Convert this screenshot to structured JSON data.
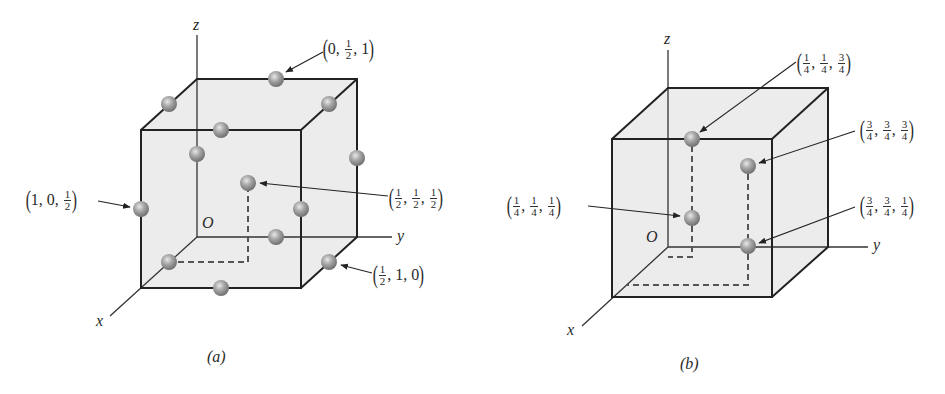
{
  "figures": [
    {
      "id": "a",
      "caption": "(a)",
      "axes": {
        "x": "x",
        "y": "y",
        "z": "z",
        "origin": "O"
      },
      "atoms": [
        {
          "label_parts": [
            {
              "t": "0"
            },
            {
              "n": "1",
              "d": "2"
            },
            {
              "t": "1"
            }
          ],
          "coords": "(0, 1/2, 1)"
        },
        {
          "label_parts": [
            {
              "t": "1"
            },
            {
              "t": "0"
            },
            {
              "n": "1",
              "d": "2"
            }
          ],
          "coords": "(1, 0, 1/2)"
        },
        {
          "label_parts": [
            {
              "n": "1",
              "d": "2"
            },
            {
              "n": "1",
              "d": "2"
            },
            {
              "n": "1",
              "d": "2"
            }
          ],
          "coords": "(1/2, 1/2, 1/2)"
        },
        {
          "label_parts": [
            {
              "n": "1",
              "d": "2"
            },
            {
              "t": "1"
            },
            {
              "t": "0"
            }
          ],
          "coords": "(1/2, 1, 0)"
        }
      ]
    },
    {
      "id": "b",
      "caption": "(b)",
      "axes": {
        "x": "x",
        "y": "y",
        "z": "z",
        "origin": "O"
      },
      "atoms": [
        {
          "label_parts": [
            {
              "n": "1",
              "d": "4"
            },
            {
              "n": "1",
              "d": "4"
            },
            {
              "n": "3",
              "d": "4"
            }
          ],
          "coords": "(1/4, 1/4, 3/4)"
        },
        {
          "label_parts": [
            {
              "n": "3",
              "d": "4"
            },
            {
              "n": "3",
              "d": "4"
            },
            {
              "n": "3",
              "d": "4"
            }
          ],
          "coords": "(3/4, 3/4, 3/4)"
        },
        {
          "label_parts": [
            {
              "n": "1",
              "d": "4"
            },
            {
              "n": "1",
              "d": "4"
            },
            {
              "n": "1",
              "d": "4"
            }
          ],
          "coords": "(1/4, 1/4, 1/4)"
        },
        {
          "label_parts": [
            {
              "n": "3",
              "d": "4"
            },
            {
              "n": "3",
              "d": "4"
            },
            {
              "n": "1",
              "d": "4"
            }
          ],
          "coords": "(3/4, 3/4, 1/4)"
        }
      ]
    }
  ],
  "colors": {
    "cube_fill": "#ebebeb",
    "edge": "#222222",
    "atom": "#9a9a9a",
    "dashed": "#555555"
  }
}
